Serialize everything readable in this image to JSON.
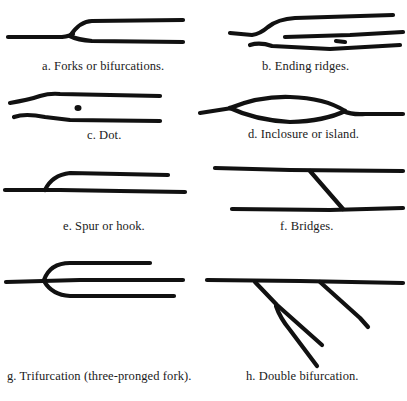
{
  "figure": {
    "panels": [
      {
        "id": "a",
        "caption": "a.  Forks or bifurcations.",
        "icon": "fork-ridge-icon"
      },
      {
        "id": "b",
        "caption": "b.  Ending ridges.",
        "icon": "ending-ridge-icon"
      },
      {
        "id": "c",
        "caption": "c.  Dot.",
        "icon": "dot-ridge-icon"
      },
      {
        "id": "d",
        "caption": "d.  Inclosure or island.",
        "icon": "island-ridge-icon"
      },
      {
        "id": "e",
        "caption": "e.  Spur or hook.",
        "icon": "spur-ridge-icon"
      },
      {
        "id": "f",
        "caption": "f.  Bridges.",
        "icon": "bridge-ridge-icon"
      },
      {
        "id": "g",
        "caption": "g.  Trifurcation (three-pronged fork).",
        "icon": "trifurcation-ridge-icon"
      },
      {
        "id": "h",
        "caption": "h.  Double bifurcation.",
        "icon": "double-bifurcation-ridge-icon"
      }
    ]
  },
  "colors": {
    "ink": "#111111",
    "background": "#ffffff"
  }
}
